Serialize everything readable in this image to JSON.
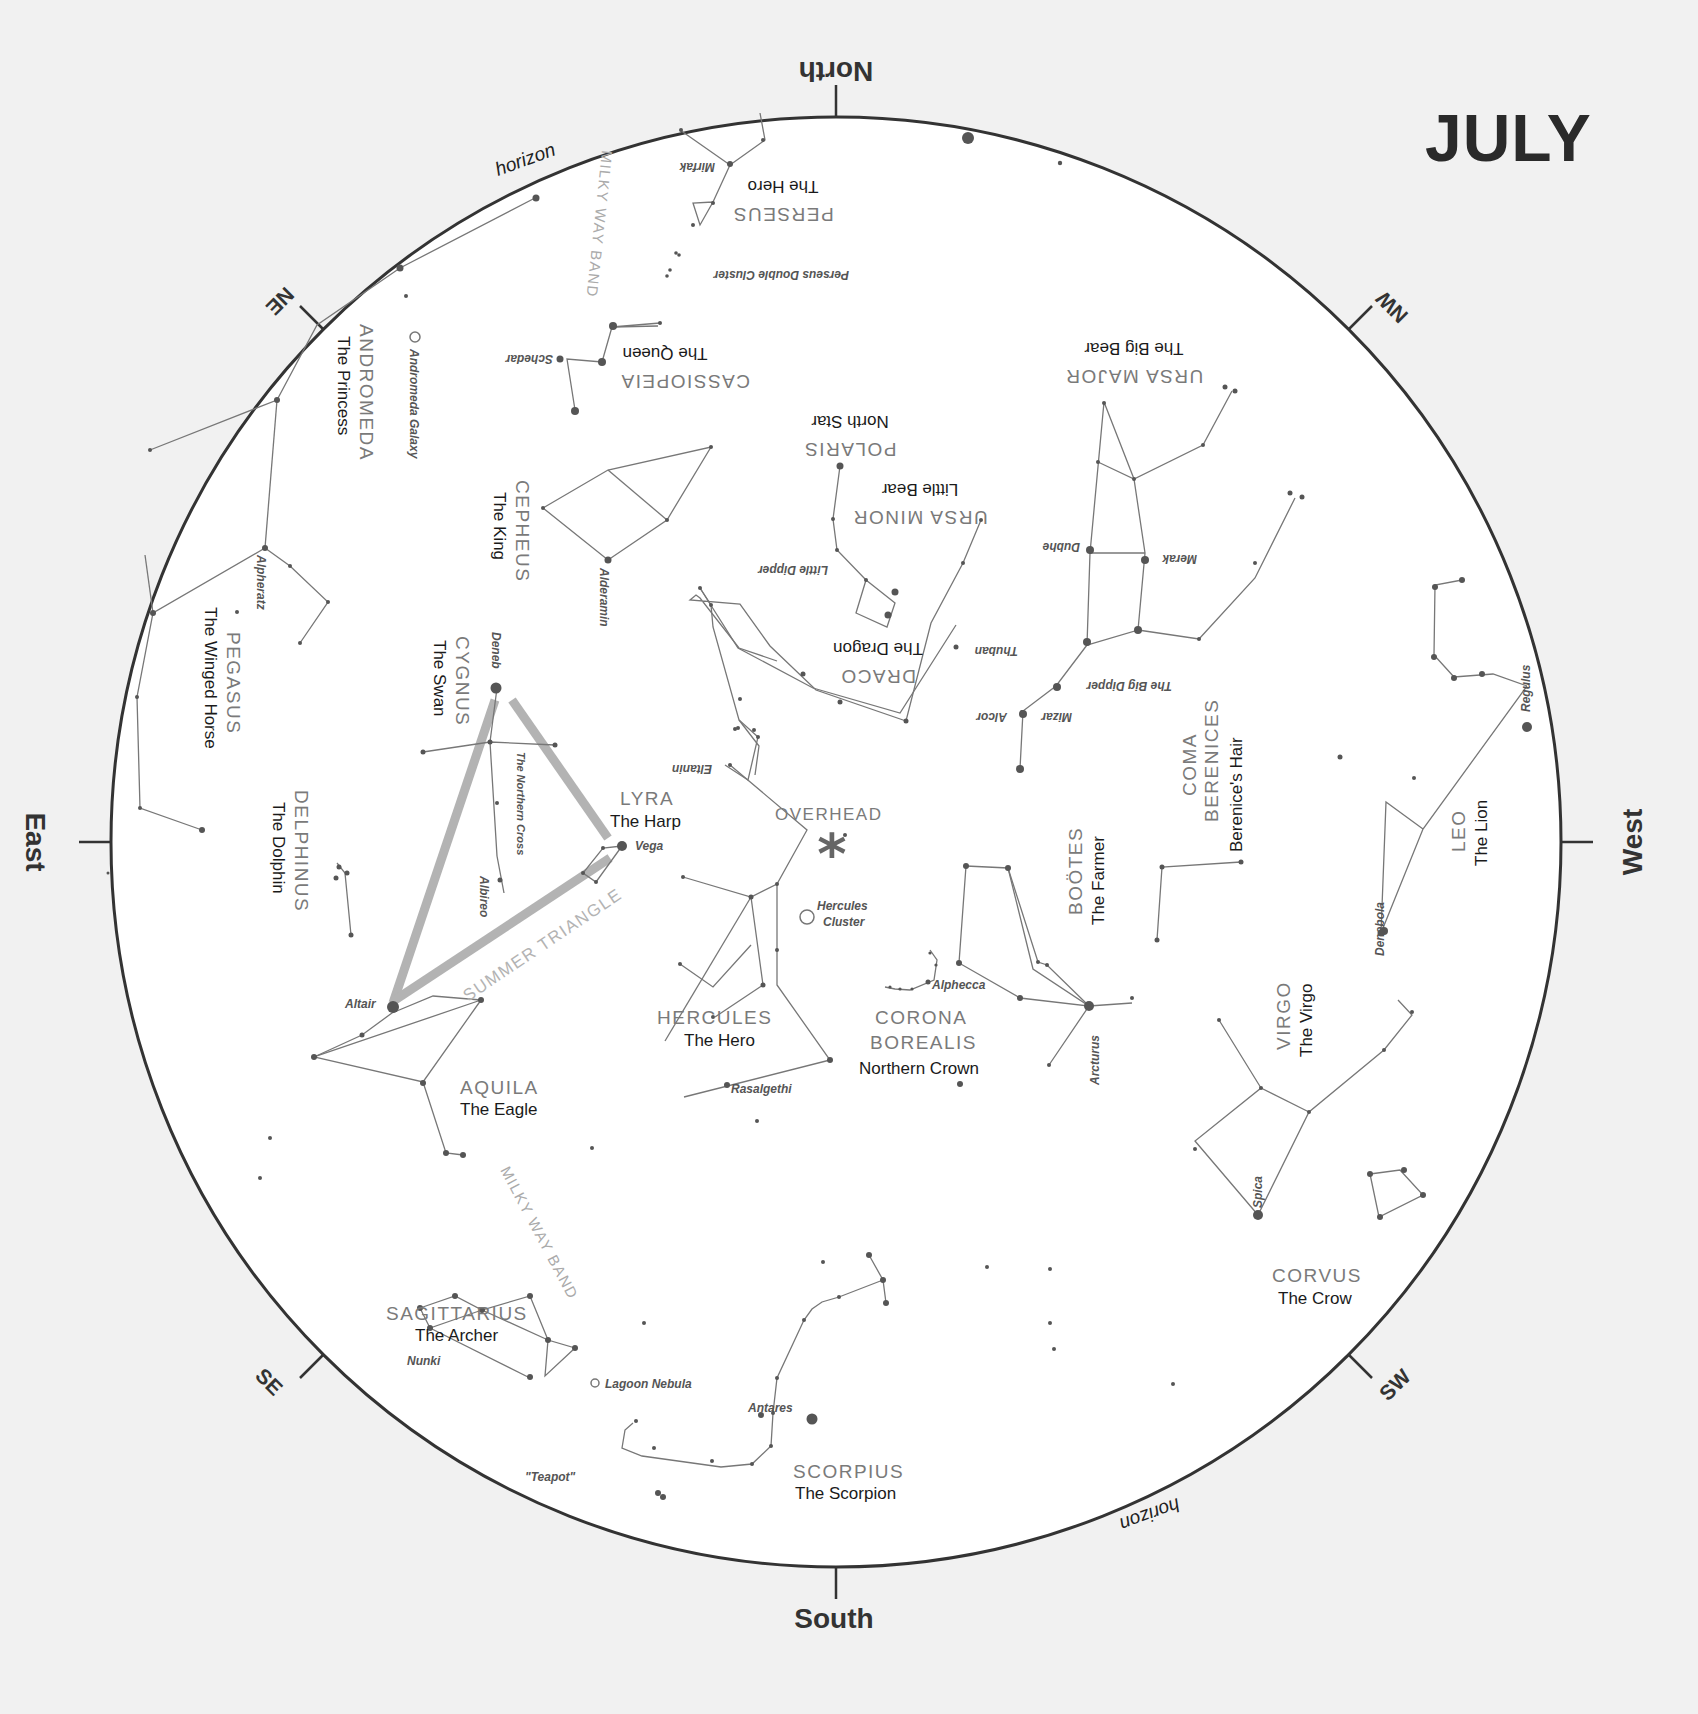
{
  "title": "JULY",
  "directions": {
    "north": "North",
    "south": "South",
    "east": "East",
    "west": "West",
    "ne": "NE",
    "nw": "NW",
    "se": "SE",
    "sw": "SW"
  },
  "horizon_label": "horizon",
  "overhead_label": "OVERHEAD",
  "milky_way_label": "MILKY WAY BAND",
  "summer_triangle_label": "SUMMER TRIANGLE",
  "northern_cross_label": "The Northern Cross",
  "constellations": {
    "perseus": {
      "name": "PERSEUS",
      "sub": "The Hero"
    },
    "cassiopeia": {
      "name": "CASSIOPEIA",
      "sub": "The Queen"
    },
    "andromeda": {
      "name": "ANDROMEDA",
      "sub": "The Princess"
    },
    "ursa_major": {
      "name": "URSA MAJOR",
      "sub": "The Big Bear"
    },
    "polaris": {
      "name": "POLARIS",
      "sub": "North Star"
    },
    "ursa_minor": {
      "name": "URSA MINOR",
      "sub": "Little Bear"
    },
    "cepheus": {
      "name": "CEPHEUS",
      "sub": "The King"
    },
    "draco": {
      "name": "DRACO",
      "sub": "The Dragon"
    },
    "pegasus": {
      "name": "PEGASUS",
      "sub": "The Winged Horse"
    },
    "cygnus": {
      "name": "CYGNUS",
      "sub": "The Swan"
    },
    "lyra": {
      "name": "LYRA",
      "sub": "The Harp"
    },
    "delphinus": {
      "name": "DELPHINUS",
      "sub": "The Dolphin"
    },
    "coma_berenices": {
      "name1": "COMA",
      "name2": "BERENICES",
      "sub": "Berenice's Hair"
    },
    "bootes": {
      "name": "BOÖTES",
      "sub": "The Farmer"
    },
    "leo": {
      "name": "LEO",
      "sub": "The Lion"
    },
    "hercules": {
      "name": "HERCULES",
      "sub": "The Hero"
    },
    "corona_borealis": {
      "name1": "CORONA",
      "name2": "BOREALIS",
      "sub": "Northern Crown"
    },
    "aquila": {
      "name": "AQUILA",
      "sub": "The Eagle"
    },
    "virgo": {
      "name": "VIRGO",
      "sub": "The Virgo"
    },
    "sagittarius": {
      "name": "SAGITTARIUS",
      "sub": "The Archer"
    },
    "scorpius": {
      "name": "SCORPIUS",
      "sub": "The Scorpion"
    },
    "corvus": {
      "name": "CORVUS",
      "sub": "The Crow"
    }
  },
  "stars": {
    "mirfak": "Mirfak",
    "schedar": "Schedar",
    "alpheratz": "Alpheratz",
    "alderamin": "Alderamin",
    "deneb": "Deneb",
    "albireo": "Albireo",
    "vega": "Vega",
    "altair": "Altair",
    "dubhe": "Dubhe",
    "merak": "Merak",
    "mizar": "Mizar",
    "alcor": "Alcor",
    "thuban": "Thuban",
    "eltanin": "Eltanin",
    "regulus": "Regulus",
    "denebola": "Denebola",
    "arcturus": "Arcturus",
    "alphecca": "Alphecca",
    "rasalgethi": "Rasalgethi",
    "spica": "Spica",
    "antares": "Antares",
    "nunki": "Nunki",
    "teapot": "\"Teapot\""
  },
  "asterisms": {
    "little_dipper": "Little Dipper",
    "big_dipper": "The Big Dipper"
  },
  "deep_sky": {
    "andromeda_galaxy": "Andromeda Galaxy",
    "perseus_double_cluster": "Perseus Double Cluster",
    "hercules_cluster_1": "Hercules",
    "hercules_cluster_2": "Cluster",
    "lagoon_nebula": "Lagoon Nebula"
  }
}
